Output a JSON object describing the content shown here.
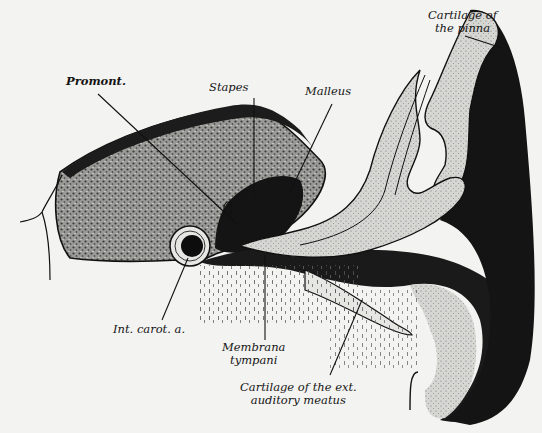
{
  "figure": {
    "colors": {
      "background": "#f3f3f1",
      "ink": "#151515",
      "bone_stipple": "#6e6e6e",
      "dark_tissue": "#1a1a1a",
      "cartilage": "#d8d8d4"
    }
  },
  "labels": {
    "cartilage_pinna": {
      "line1": "Cartilage of",
      "line2": "the pinna"
    },
    "promont": "Promont.",
    "stapes": "Stapes",
    "malleus": "Malleus",
    "int_carot": "Int. carot. a.",
    "membrana": {
      "line1": "Membrana",
      "line2": "tympani"
    },
    "cartilage_meatus": {
      "line1": "Cartilage of the ext.",
      "line2": "auditory meatus"
    }
  }
}
